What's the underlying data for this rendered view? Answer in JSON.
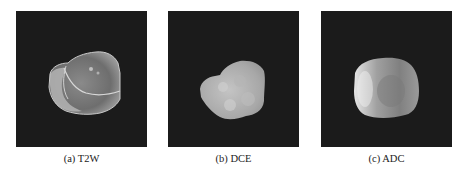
{
  "figure": {
    "panels": [
      {
        "id": "a",
        "caption": "(a) T2W",
        "modality": "T2W"
      },
      {
        "id": "b",
        "caption": "(b) DCE",
        "modality": "DCE"
      },
      {
        "id": "c",
        "caption": "(c) ADC",
        "modality": "ADC"
      }
    ],
    "colors": {
      "background": "#1b1b1b",
      "page": "#ffffff"
    }
  }
}
